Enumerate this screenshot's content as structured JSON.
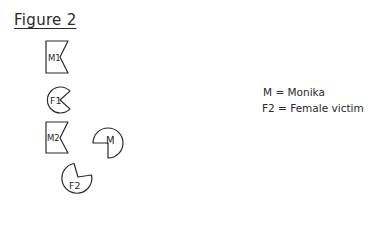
{
  "figure": {
    "title": "Figure 2",
    "shapes": [
      {
        "id": "M1",
        "label": "M1",
        "kind": "notched-box"
      },
      {
        "id": "F1",
        "label": "F1",
        "kind": "pacman"
      },
      {
        "id": "M2",
        "label": "M2",
        "kind": "notched-box"
      },
      {
        "id": "M",
        "label": "M",
        "kind": "pacman"
      },
      {
        "id": "F2",
        "label": "F2",
        "kind": "pacman"
      }
    ],
    "stroke_color": "#2a2a2a"
  },
  "legend": {
    "items": [
      {
        "text": "M = Monika"
      },
      {
        "text": "F2 = Female victim"
      }
    ]
  }
}
